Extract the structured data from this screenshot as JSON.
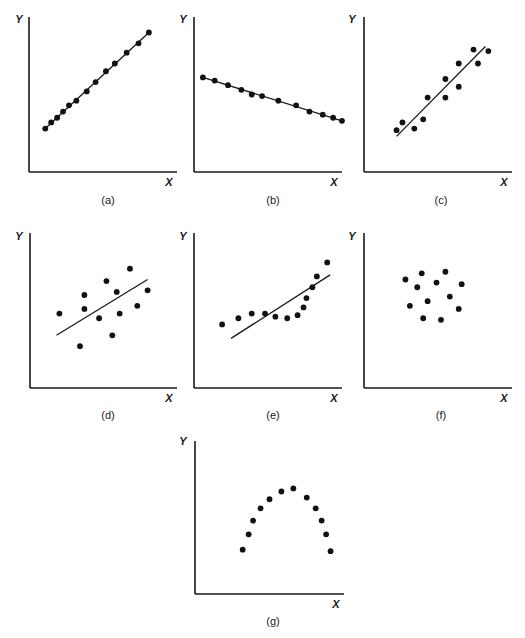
{
  "chart_data": [
    {
      "type": "scatter",
      "panel": "(a)",
      "title": "",
      "xlabel": "X",
      "ylabel": "Y",
      "xlim": [
        0,
        10
      ],
      "ylim": [
        0,
        10
      ],
      "grid": false,
      "fit_line": true,
      "fit_line_through_points": true,
      "points": [
        [
          1.1,
          2.8
        ],
        [
          1.5,
          3.2
        ],
        [
          1.9,
          3.5
        ],
        [
          2.3,
          3.9
        ],
        [
          2.7,
          4.3
        ],
        [
          3.2,
          4.6
        ],
        [
          3.9,
          5.2
        ],
        [
          4.5,
          5.8
        ],
        [
          5.2,
          6.5
        ],
        [
          5.8,
          7.0
        ],
        [
          6.6,
          7.7
        ],
        [
          7.4,
          8.3
        ],
        [
          8.1,
          9.0
        ]
      ],
      "line": [
        [
          1.1,
          2.8
        ],
        [
          8.1,
          9.0
        ]
      ]
    },
    {
      "type": "scatter",
      "panel": "(b)",
      "title": "",
      "xlabel": "X",
      "ylabel": "Y",
      "xlim": [
        0,
        10
      ],
      "ylim": [
        0,
        10
      ],
      "grid": false,
      "fit_line": true,
      "points": [
        [
          0.6,
          6.1
        ],
        [
          1.4,
          5.9
        ],
        [
          2.3,
          5.6
        ],
        [
          3.2,
          5.3
        ],
        [
          3.9,
          5.0
        ],
        [
          4.6,
          4.9
        ],
        [
          5.7,
          4.6
        ],
        [
          6.9,
          4.3
        ],
        [
          7.8,
          3.9
        ],
        [
          8.7,
          3.7
        ],
        [
          9.4,
          3.5
        ],
        [
          10.0,
          3.3
        ]
      ],
      "line": [
        [
          0.6,
          6.1
        ],
        [
          10.0,
          3.3
        ]
      ]
    },
    {
      "type": "scatter",
      "panel": "(c)",
      "title": "",
      "xlabel": "X",
      "ylabel": "Y",
      "xlim": [
        0,
        10
      ],
      "ylim": [
        0,
        10
      ],
      "grid": false,
      "fit_line": true,
      "points": [
        [
          2.2,
          2.7
        ],
        [
          2.6,
          3.2
        ],
        [
          3.4,
          2.8
        ],
        [
          4.0,
          3.4
        ],
        [
          4.3,
          4.8
        ],
        [
          5.5,
          6.0
        ],
        [
          5.5,
          4.8
        ],
        [
          6.4,
          7.0
        ],
        [
          6.4,
          5.5
        ],
        [
          7.4,
          7.9
        ],
        [
          7.7,
          7.0
        ],
        [
          8.4,
          7.8
        ]
      ],
      "line": [
        [
          2.2,
          2.3
        ],
        [
          8.2,
          8.1
        ]
      ]
    },
    {
      "type": "scatter",
      "panel": "(d)",
      "title": "",
      "xlabel": "X",
      "ylabel": "Y",
      "xlim": [
        0,
        10
      ],
      "ylim": [
        0,
        10
      ],
      "grid": false,
      "fit_line": true,
      "points": [
        [
          2.0,
          4.8
        ],
        [
          3.4,
          2.7
        ],
        [
          3.7,
          5.1
        ],
        [
          3.7,
          6.0
        ],
        [
          4.7,
          4.5
        ],
        [
          5.2,
          6.9
        ],
        [
          5.6,
          3.4
        ],
        [
          5.9,
          6.2
        ],
        [
          6.1,
          4.8
        ],
        [
          6.8,
          7.7
        ],
        [
          7.3,
          5.3
        ],
        [
          8.0,
          6.3
        ]
      ],
      "line": [
        [
          1.8,
          3.4
        ],
        [
          8.0,
          7.0
        ]
      ]
    },
    {
      "type": "scatter",
      "panel": "(e)",
      "title": "",
      "xlabel": "X",
      "ylabel": "Y",
      "xlim": [
        0,
        10
      ],
      "ylim": [
        0,
        10
      ],
      "grid": false,
      "fit_line": true,
      "points": [
        [
          1.9,
          4.1
        ],
        [
          3.0,
          4.5
        ],
        [
          3.9,
          4.8
        ],
        [
          4.8,
          4.8
        ],
        [
          5.5,
          4.6
        ],
        [
          6.3,
          4.5
        ],
        [
          7.0,
          4.7
        ],
        [
          7.4,
          5.2
        ],
        [
          7.6,
          5.8
        ],
        [
          8.0,
          6.5
        ],
        [
          8.3,
          7.2
        ],
        [
          9.0,
          8.1
        ]
      ],
      "line": [
        [
          2.5,
          3.2
        ],
        [
          9.2,
          7.3
        ]
      ]
    },
    {
      "type": "scatter",
      "panel": "(f)",
      "title": "",
      "xlabel": "X",
      "ylabel": "Y",
      "xlim": [
        0,
        10
      ],
      "ylim": [
        0,
        10
      ],
      "grid": false,
      "fit_line": false,
      "points": [
        [
          2.8,
          7.0
        ],
        [
          3.9,
          7.4
        ],
        [
          5.5,
          7.5
        ],
        [
          3.6,
          6.5
        ],
        [
          4.9,
          6.8
        ],
        [
          6.6,
          6.7
        ],
        [
          3.1,
          5.3
        ],
        [
          4.3,
          5.6
        ],
        [
          5.8,
          5.9
        ],
        [
          6.4,
          5.1
        ],
        [
          4.0,
          4.5
        ],
        [
          5.2,
          4.4
        ]
      ],
      "line": null
    },
    {
      "type": "scatter",
      "panel": "(g)",
      "title": "",
      "xlabel": "X",
      "ylabel": "Y",
      "xlim": [
        0,
        10
      ],
      "ylim": [
        0,
        10
      ],
      "grid": false,
      "fit_line": false,
      "points": [
        [
          3.2,
          2.9
        ],
        [
          3.6,
          3.9
        ],
        [
          3.9,
          4.8
        ],
        [
          4.4,
          5.6
        ],
        [
          5.0,
          6.2
        ],
        [
          5.8,
          6.7
        ],
        [
          6.6,
          6.9
        ],
        [
          7.5,
          6.3
        ],
        [
          8.1,
          5.6
        ],
        [
          8.5,
          4.8
        ],
        [
          8.8,
          3.9
        ],
        [
          9.1,
          2.8
        ]
      ],
      "line": null
    }
  ]
}
